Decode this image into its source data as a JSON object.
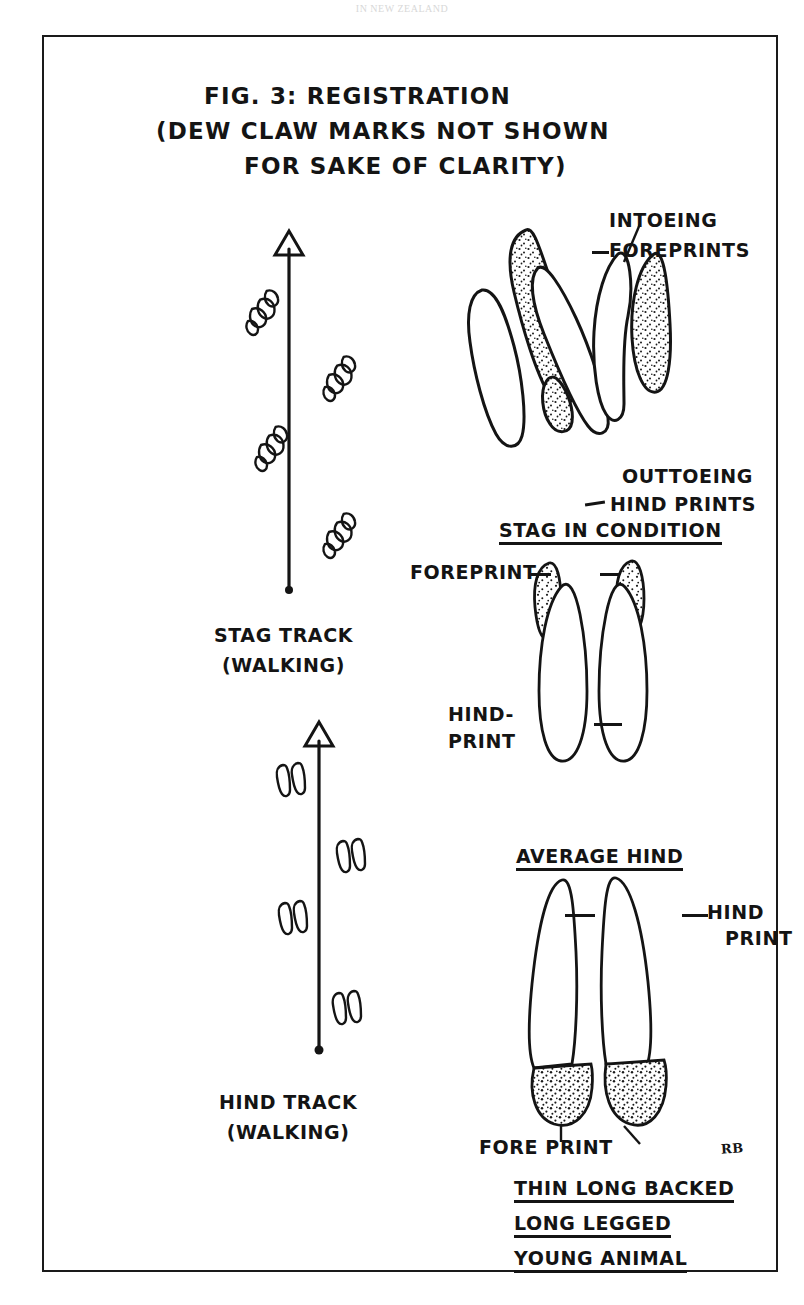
{
  "page": {
    "running_head": "IN NEW ZEALAND",
    "background_color": "#ffffff",
    "ink_color": "#141414"
  },
  "figure": {
    "title_lines": [
      "FIG. 3: REGISTRATION",
      "(DEW CLAW MARKS NOT SHOWN",
      "FOR SAKE OF CLARITY)"
    ],
    "signature": "RB"
  },
  "tracks": [
    {
      "id": "stag-track",
      "caption_line1": "STAG TRACK",
      "caption_line2": "(WALKING)",
      "direction": "up",
      "print_count": 4
    },
    {
      "id": "hind-track",
      "caption_line1": "HIND TRACK",
      "caption_line2": "(WALKING)",
      "direction": "up",
      "print_count": 4
    }
  ],
  "panels": [
    {
      "id": "stag-in-condition",
      "heading": "STAG IN CONDITION",
      "labels": [
        {
          "id": "intoeing-foreprints",
          "line1": "INTOEING",
          "line2": "FOREPRINTS"
        },
        {
          "id": "outtoeing-hindprints",
          "line1": "OUTTOEING",
          "line2": "HIND PRINTS"
        }
      ]
    },
    {
      "id": "average-hind",
      "heading": "AVERAGE HIND",
      "labels": [
        {
          "id": "foreprint",
          "line1": "FOREPRINT",
          "line2": ""
        },
        {
          "id": "hind-print",
          "line1": "HIND-",
          "line2": "PRINT"
        }
      ]
    },
    {
      "id": "young-animal",
      "heading_lines": [
        "THIN LONG BACKED",
        "LONG LEGGED",
        "YOUNG ANIMAL"
      ],
      "labels": [
        {
          "id": "hind-print",
          "line1": "HIND",
          "line2": "PRINT"
        },
        {
          "id": "fore-print",
          "line1": "FORE PRINT",
          "line2": ""
        }
      ]
    }
  ]
}
